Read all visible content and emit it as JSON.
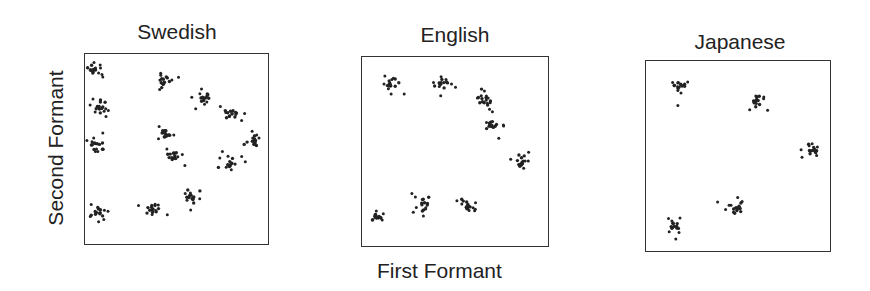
{
  "figure": {
    "ylabel": "Second Formant",
    "xlabel": "First Formant"
  },
  "panels": [
    {
      "title": "Swedish"
    },
    {
      "title": "English"
    },
    {
      "title": "Japanese"
    }
  ],
  "chart_data": {
    "type": "scatter",
    "title": "",
    "xlabel": "First Formant",
    "ylabel": "Second Formant",
    "grid": false,
    "legend": null,
    "axis_ticks": "none",
    "note": "Coordinates are normalized cluster centers within each panel (x: 0=left,1=right; y: 0=top,1=bottom). Each cluster is drawn as ~12-16 scattered dots.",
    "series": [
      {
        "name": "Swedish",
        "clusters": [
          {
            "x": 0.05,
            "y": 0.08
          },
          {
            "x": 0.09,
            "y": 0.28
          },
          {
            "x": 0.07,
            "y": 0.48
          },
          {
            "x": 0.07,
            "y": 0.83
          },
          {
            "x": 0.43,
            "y": 0.14
          },
          {
            "x": 0.65,
            "y": 0.22
          },
          {
            "x": 0.8,
            "y": 0.32
          },
          {
            "x": 0.91,
            "y": 0.46
          },
          {
            "x": 0.44,
            "y": 0.42
          },
          {
            "x": 0.49,
            "y": 0.54
          },
          {
            "x": 0.79,
            "y": 0.58
          },
          {
            "x": 0.58,
            "y": 0.75
          },
          {
            "x": 0.37,
            "y": 0.82
          }
        ]
      },
      {
        "name": "English",
        "clusters": [
          {
            "x": 0.15,
            "y": 0.14
          },
          {
            "x": 0.44,
            "y": 0.15
          },
          {
            "x": 0.66,
            "y": 0.22
          },
          {
            "x": 0.7,
            "y": 0.36
          },
          {
            "x": 0.86,
            "y": 0.55
          },
          {
            "x": 0.32,
            "y": 0.78
          },
          {
            "x": 0.57,
            "y": 0.78
          },
          {
            "x": 0.08,
            "y": 0.85
          }
        ]
      },
      {
        "name": "Japanese",
        "clusters": [
          {
            "x": 0.19,
            "y": 0.13
          },
          {
            "x": 0.6,
            "y": 0.21
          },
          {
            "x": 0.9,
            "y": 0.46
          },
          {
            "x": 0.49,
            "y": 0.77
          },
          {
            "x": 0.15,
            "y": 0.86
          }
        ]
      }
    ]
  }
}
